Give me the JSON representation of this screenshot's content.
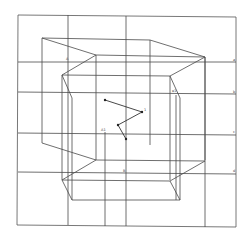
{
  "diagram": {
    "type": "perspective wireframe box with grid and zigzag path",
    "labels": {
      "top_left_node": "A",
      "right_tick_1": "a",
      "right_tick_2": "b",
      "right_tick_3": "c",
      "right_tick_4": "d",
      "inner_right_node": "e1",
      "left_inner_node": "A1",
      "bottom_center_node": "B",
      "zigzag_1": "",
      "zigzag_2": "1",
      "zigzag_3": "",
      "zigzag_4": ""
    },
    "colors": {
      "line": "#4a4a4a",
      "background": "#ffffff"
    }
  }
}
